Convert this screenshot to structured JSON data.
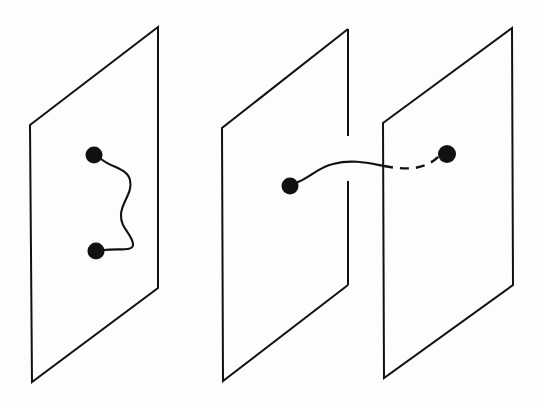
{
  "figure": {
    "title": "",
    "background_color": "#fdfdfb",
    "ink_color": "#111111",
    "width": 538,
    "height": 402
  },
  "planes": [
    {
      "id": "left-plane",
      "label": "",
      "corners": "30,125 158,27 158,288 32,382",
      "has_gap": false
    },
    {
      "id": "middle-plane",
      "label": "",
      "corners": "222,128 348,29 348,285 223,381",
      "has_gap": true,
      "gap_top_segment": "M348,29 L348,136",
      "gap_bottom_segment": "M348,181 L348,285",
      "outline_without_right_edge": "M348,29 L222,128 L223,381 L348,285"
    },
    {
      "id": "right-plane",
      "label": "",
      "corners": "383,123 512,28 513,285 384,378",
      "has_gap": false
    }
  ],
  "nodes": [
    {
      "id": "left-upper-point",
      "cx": 94,
      "cy": 155,
      "r": 8.5,
      "label": ""
    },
    {
      "id": "left-lower-point",
      "cx": 96,
      "cy": 251,
      "r": 8.5,
      "label": ""
    },
    {
      "id": "middle-point",
      "cx": 290,
      "cy": 186,
      "r": 8.5,
      "label": ""
    },
    {
      "id": "right-point",
      "cx": 447,
      "cy": 154,
      "r": 9.0,
      "label": ""
    }
  ],
  "paths": [
    {
      "id": "wavy-path-in-plane",
      "style": "solid",
      "description": "wavy curve joining the two points inside the left plane",
      "d": "M101,159 C112,168 127,168 130,180 C133,193 122,201 121,214 C120,228 132,234 133,244 C134,252 118,248 104,250"
    },
    {
      "id": "crossing-path-solid",
      "style": "solid",
      "description": "solid portion of the path from the middle point up and across through the gap in the middle plane",
      "d": "M298,182 C312,176 319,167 333,164 C352,159 368,163 384,166"
    },
    {
      "id": "crossing-path-dashed",
      "style": "dashed",
      "description": "hidden (dashed) portion of the path behind the right plane ending at the right point",
      "d": "M384,166 C400,169 416,170 428,164 C434,161 437,158 439,156"
    }
  ]
}
